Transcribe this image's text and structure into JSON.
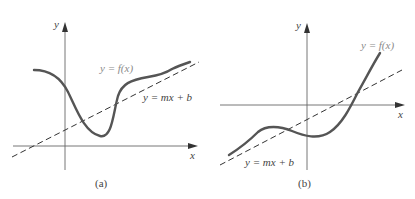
{
  "panels": [
    {
      "id": "a",
      "caption": "(a)",
      "x_axis_label": "x",
      "y_axis_label": "y",
      "curve_label": "y = f(x)",
      "line_label": "y = mx + b"
    },
    {
      "id": "b",
      "caption": "(b)",
      "x_axis_label": "x",
      "y_axis_label": "y",
      "curve_label": "y = f(x)",
      "line_label": "y = mx + b"
    }
  ],
  "colors": {
    "curve": "#555555",
    "axis": "#666666",
    "dashed_line": "#333333",
    "curve_label": "#8a8a8a",
    "text": "#444444"
  }
}
